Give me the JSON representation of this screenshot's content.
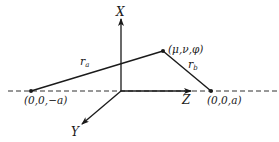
{
  "diagram": {
    "axes": {
      "x_label": "X",
      "y_label": "Y",
      "z_label": "Z"
    },
    "points": {
      "left_focus": "(0,0,−a)",
      "right_focus": "(0,0,a)",
      "general_point": "(μ,ν,φ)"
    },
    "distances": {
      "r_a": "r",
      "r_a_sub": "a",
      "r_b": "r",
      "r_b_sub": "b"
    },
    "colors": {
      "line": "#1a1a1a",
      "background": "#ffffff"
    }
  }
}
